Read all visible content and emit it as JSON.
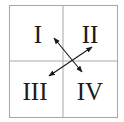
{
  "diagram": {
    "type": "quadrant-grid",
    "colors": {
      "grid": "#a8a8a8",
      "text": "#1a1a1a",
      "arrow": "#1a1a1a",
      "background": "#ffffff"
    },
    "quadrants": [
      {
        "id": "top-left",
        "label": "I"
      },
      {
        "id": "top-right",
        "label": "II"
      },
      {
        "id": "bottom-left",
        "label": "III"
      },
      {
        "id": "bottom-right",
        "label": "IV"
      }
    ],
    "arrows": [
      {
        "from": "I",
        "to": "IV",
        "double_headed": true
      },
      {
        "from": "III",
        "to": "II",
        "double_headed": true
      }
    ]
  }
}
